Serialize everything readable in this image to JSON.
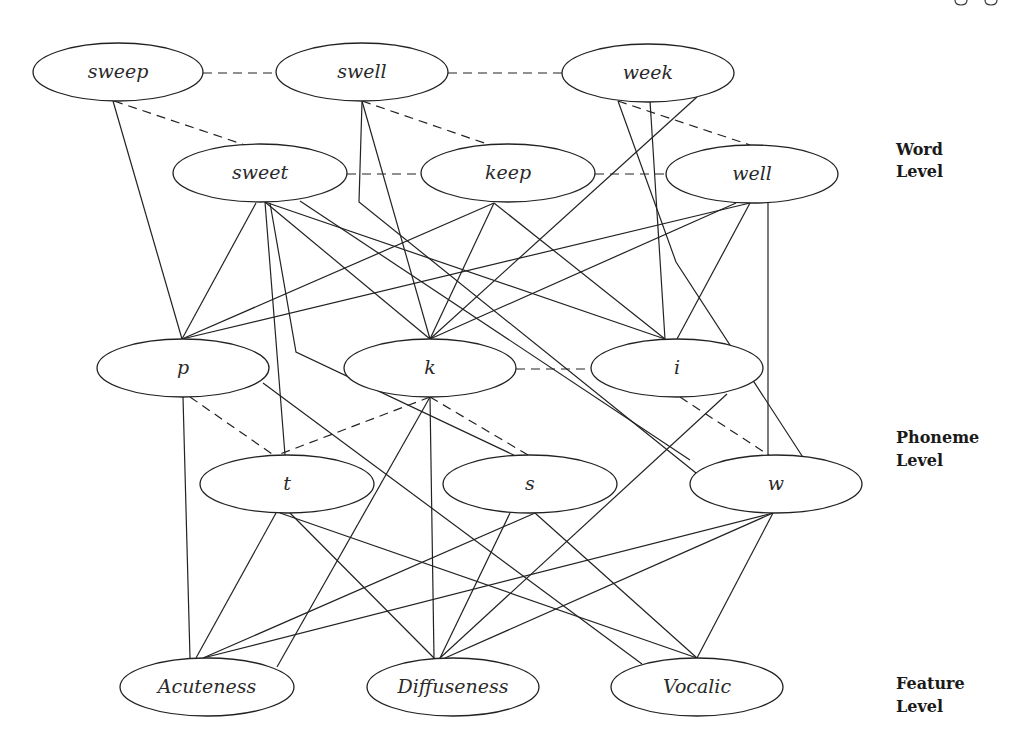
{
  "diagram": {
    "type": "interactive-activation network",
    "levels": [
      {
        "id": "word",
        "label_line1": "Word",
        "label_line2": "Level",
        "x": 896,
        "y1": 155,
        "y2": 177
      },
      {
        "id": "phoneme",
        "label_line1": "Phoneme",
        "label_line2": "Level",
        "x": 896,
        "y1": 443,
        "y2": 466
      },
      {
        "id": "feature",
        "label_line1": "Feature",
        "label_line2": "Level",
        "x": 896,
        "y1": 689,
        "y2": 712
      }
    ],
    "nodes": [
      {
        "id": "sweep",
        "label": "sweep",
        "level": "word",
        "cx": 118,
        "cy": 72,
        "rx": 85,
        "ry": 29
      },
      {
        "id": "swell",
        "label": "swell",
        "level": "word",
        "cx": 362,
        "cy": 72,
        "rx": 86,
        "ry": 29
      },
      {
        "id": "week",
        "label": "week",
        "level": "word",
        "cx": 648,
        "cy": 73,
        "rx": 86,
        "ry": 29
      },
      {
        "id": "sweet",
        "label": "sweet",
        "level": "word",
        "cx": 260,
        "cy": 173,
        "rx": 87,
        "ry": 29
      },
      {
        "id": "keep",
        "label": "keep",
        "level": "word",
        "cx": 508,
        "cy": 173,
        "rx": 87,
        "ry": 29
      },
      {
        "id": "well",
        "label": "well",
        "level": "word",
        "cx": 752,
        "cy": 174,
        "rx": 86,
        "ry": 29
      },
      {
        "id": "p",
        "label": "p",
        "level": "phoneme",
        "cx": 183,
        "cy": 368,
        "rx": 86,
        "ry": 29
      },
      {
        "id": "k",
        "label": "k",
        "level": "phoneme",
        "cx": 430,
        "cy": 368,
        "rx": 86,
        "ry": 29
      },
      {
        "id": "i",
        "label": "i",
        "level": "phoneme",
        "cx": 677,
        "cy": 368,
        "rx": 86,
        "ry": 29
      },
      {
        "id": "t",
        "label": "t",
        "level": "phoneme",
        "cx": 287,
        "cy": 484,
        "rx": 87,
        "ry": 29
      },
      {
        "id": "s",
        "label": "s",
        "level": "phoneme",
        "cx": 530,
        "cy": 484,
        "rx": 87,
        "ry": 29
      },
      {
        "id": "w",
        "label": "w",
        "level": "phoneme",
        "cx": 776,
        "cy": 484,
        "rx": 86,
        "ry": 29
      },
      {
        "id": "acuteness",
        "label": "Acuteness",
        "level": "feature",
        "cx": 207,
        "cy": 687,
        "rx": 87,
        "ry": 29
      },
      {
        "id": "diffuseness",
        "label": "Diffuseness",
        "level": "feature",
        "cx": 453,
        "cy": 687,
        "rx": 86,
        "ry": 29
      },
      {
        "id": "vocalic",
        "label": "Vocalic",
        "level": "feature",
        "cx": 697,
        "cy": 687,
        "rx": 86,
        "ry": 29
      }
    ],
    "edges": {
      "inhibitory_dashed": [
        {
          "from": "sweep",
          "to": "swell",
          "points": [
            [
              203,
              73
            ],
            [
              276,
              73
            ]
          ]
        },
        {
          "from": "swell",
          "to": "week",
          "points": [
            [
              448,
              73
            ],
            [
              562,
              73
            ]
          ]
        },
        {
          "from": "sweep",
          "to": "sweet",
          "points": [
            [
              114,
              101
            ],
            [
              245,
              145
            ]
          ]
        },
        {
          "from": "swell",
          "to": "keep",
          "points": [
            [
              362,
              101
            ],
            [
              490,
              145
            ]
          ]
        },
        {
          "from": "week",
          "to": "well",
          "points": [
            [
              618,
              101
            ],
            [
              750,
              145
            ]
          ]
        },
        {
          "from": "sweet",
          "to": "keep",
          "points": [
            [
              347,
              174
            ],
            [
              421,
              174
            ]
          ]
        },
        {
          "from": "keep",
          "to": "well",
          "points": [
            [
              595,
              174
            ],
            [
              666,
              174
            ]
          ]
        },
        {
          "from": "k",
          "to": "i",
          "points": [
            [
              516,
              369
            ],
            [
              591,
              369
            ]
          ]
        },
        {
          "from": "p",
          "to": "t",
          "points": [
            [
              190,
              397
            ],
            [
              275,
              456
            ]
          ]
        },
        {
          "from": "k",
          "to": "t",
          "points": [
            [
              430,
              397
            ],
            [
              275,
              456
            ]
          ]
        },
        {
          "from": "k",
          "to": "s",
          "points": [
            [
              430,
              397
            ],
            [
              528,
              455
            ]
          ]
        },
        {
          "from": "i",
          "to": "w",
          "points": [
            [
              680,
              397
            ],
            [
              770,
              456
            ]
          ]
        }
      ],
      "excitatory_solid": [
        {
          "from": "sweep",
          "to": "p",
          "points": [
            [
              113,
              101
            ],
            [
              182,
              339
            ]
          ]
        },
        {
          "from": "swell",
          "to": "k",
          "points": [
            [
              362,
              101
            ],
            [
              430,
              339
            ]
          ]
        },
        {
          "from": "swell",
          "to": "w",
          "points": [
            [
              362,
              102
            ],
            [
              359,
              202
            ],
            [
              696,
              473
            ]
          ]
        },
        {
          "from": "week",
          "to": "k",
          "points": [
            [
              697,
              97
            ],
            [
              430,
              339
            ]
          ]
        },
        {
          "from": "week",
          "to": "i",
          "points": [
            [
              650,
              101
            ],
            [
              665,
              339
            ]
          ]
        },
        {
          "from": "week",
          "to": "w",
          "points": [
            [
              618,
              101
            ],
            [
              676,
              262
            ],
            [
              808,
              465
            ]
          ]
        },
        {
          "from": "sweet",
          "to": "p",
          "points": [
            [
              256,
              203
            ],
            [
              182,
              339
            ]
          ]
        },
        {
          "from": "sweet",
          "to": "k",
          "points": [
            [
              265,
              202
            ],
            [
              430,
              339
            ]
          ]
        },
        {
          "from": "sweet",
          "to": "i",
          "points": [
            [
              265,
              202
            ],
            [
              665,
              339
            ]
          ]
        },
        {
          "from": "sweet",
          "to": "t",
          "points": [
            [
              265,
              202
            ],
            [
              285,
              455
            ]
          ]
        },
        {
          "from": "sweet",
          "to": "s",
          "points": [
            [
              270,
              203
            ],
            [
              296,
              352
            ],
            [
              520,
              458
            ]
          ]
        },
        {
          "from": "sweet",
          "to": "w",
          "points": [
            [
              300,
              201
            ],
            [
              690,
              460
            ]
          ]
        },
        {
          "from": "keep",
          "to": "p",
          "points": [
            [
              494,
              203
            ],
            [
              182,
              339
            ]
          ]
        },
        {
          "from": "keep",
          "to": "k",
          "points": [
            [
              494,
              203
            ],
            [
              430,
              339
            ]
          ]
        },
        {
          "from": "keep",
          "to": "i",
          "points": [
            [
              494,
              203
            ],
            [
              665,
              339
            ]
          ]
        },
        {
          "from": "well",
          "to": "p",
          "points": [
            [
              750,
              203
            ],
            [
              182,
              339
            ]
          ]
        },
        {
          "from": "well",
          "to": "k",
          "points": [
            [
              736,
              203
            ],
            [
              430,
              339
            ]
          ]
        },
        {
          "from": "well",
          "to": "i",
          "points": [
            [
              750,
              203
            ],
            [
              677,
              339
            ]
          ]
        },
        {
          "from": "well",
          "to": "w",
          "points": [
            [
              768,
              203
            ],
            [
              768,
              455
            ]
          ]
        },
        {
          "from": "p",
          "to": "acuteness",
          "points": [
            [
              183,
              397
            ],
            [
              190,
              658
            ]
          ]
        },
        {
          "from": "p",
          "to": "vocalic",
          "points": [
            [
              263,
              383
            ],
            [
              642,
              664
            ]
          ]
        },
        {
          "from": "k",
          "to": "acuteness",
          "points": [
            [
              430,
              397
            ],
            [
              277,
              667
            ]
          ]
        },
        {
          "from": "k",
          "to": "diffuseness",
          "points": [
            [
              430,
              397
            ],
            [
              434,
              658
            ]
          ]
        },
        {
          "from": "i",
          "to": "diffuseness",
          "points": [
            [
              727,
              394
            ],
            [
              440,
              658
            ]
          ]
        },
        {
          "from": "t",
          "to": "acuteness",
          "points": [
            [
              276,
              513
            ],
            [
              196,
              658
            ]
          ]
        },
        {
          "from": "t",
          "to": "diffuseness",
          "points": [
            [
              290,
              513
            ],
            [
              434,
              658
            ]
          ]
        },
        {
          "from": "t",
          "to": "vocalic",
          "points": [
            [
              280,
              513
            ],
            [
              697,
              658
            ]
          ]
        },
        {
          "from": "s",
          "to": "acuteness",
          "points": [
            [
              535,
              513
            ],
            [
              203,
              658
            ]
          ]
        },
        {
          "from": "s",
          "to": "diffuseness",
          "points": [
            [
              510,
              513
            ],
            [
              440,
              658
            ]
          ]
        },
        {
          "from": "s",
          "to": "vocalic",
          "points": [
            [
              535,
              513
            ],
            [
              697,
              658
            ]
          ]
        },
        {
          "from": "w",
          "to": "acuteness",
          "points": [
            [
              773,
              513
            ],
            [
              203,
              658
            ]
          ]
        },
        {
          "from": "w",
          "to": "diffuseness",
          "points": [
            [
              773,
              513
            ],
            [
              445,
              658
            ]
          ]
        },
        {
          "from": "w",
          "to": "vocalic",
          "points": [
            [
              773,
              513
            ],
            [
              697,
              658
            ]
          ]
        }
      ]
    }
  }
}
